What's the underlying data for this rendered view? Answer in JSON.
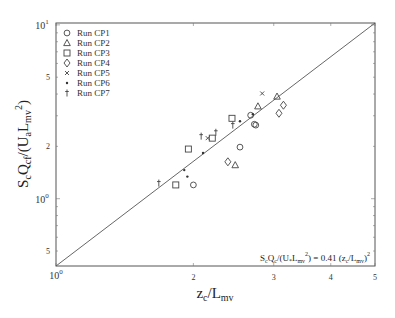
{
  "chart_data": {
    "type": "scatter",
    "title": "",
    "xlabel": "z_c/L_mv",
    "ylabel": "S_cQ_d/(U_aL_mv^2)",
    "xscale": "log",
    "yscale": "log",
    "xlim": [
      1,
      5
    ],
    "ylim": [
      0.41,
      10.25
    ],
    "x_ticks": [
      {
        "value": 1,
        "label": "10",
        "sup": "0"
      },
      {
        "value": 2,
        "label": "2"
      },
      {
        "value": 3,
        "label": "3"
      },
      {
        "value": 4,
        "label": "4"
      },
      {
        "value": 5,
        "label": "5"
      }
    ],
    "y_ticks": [
      {
        "value": 0.5,
        "label": "5"
      },
      {
        "value": 1,
        "label": "10",
        "sup": "0"
      },
      {
        "value": 2,
        "label": "2"
      },
      {
        "value": 5,
        "label": "5"
      },
      {
        "value": 10,
        "label": "10",
        "sup": "1"
      }
    ],
    "grid": false,
    "legend_position": "upper-left",
    "fit_line": {
      "coef": 0.41,
      "power": 2,
      "label": "S_cQ_c/(U_*L_mv^2) = 0.41 (z_c/L_mv)^2"
    },
    "series": [
      {
        "name": "Run CP1",
        "marker": "circle",
        "points": [
          [
            2.0,
            1.2
          ],
          [
            2.53,
            1.98
          ],
          [
            2.72,
            2.68
          ],
          [
            2.74,
            2.65
          ],
          [
            2.67,
            3.02
          ]
        ]
      },
      {
        "name": "Run CP2",
        "marker": "triangle",
        "points": [
          [
            2.47,
            1.56
          ],
          [
            2.77,
            3.4
          ],
          [
            3.05,
            3.87
          ]
        ]
      },
      {
        "name": "Run CP3",
        "marker": "square",
        "points": [
          [
            1.83,
            1.2
          ],
          [
            1.95,
            1.93
          ],
          [
            2.2,
            2.23
          ],
          [
            2.43,
            2.9
          ]
        ]
      },
      {
        "name": "Run CP4",
        "marker": "diamond",
        "points": [
          [
            2.38,
            1.63
          ],
          [
            3.08,
            3.1
          ],
          [
            3.15,
            3.45
          ]
        ]
      },
      {
        "name": "Run CP5",
        "marker": "x",
        "points": [
          [
            2.83,
            4.03
          ],
          [
            2.15,
            2.23
          ]
        ]
      },
      {
        "name": "Run CP6",
        "marker": "star",
        "points": [
          [
            1.91,
            1.46
          ],
          [
            1.94,
            1.34
          ],
          [
            2.1,
            1.83
          ],
          [
            2.53,
            2.79
          ],
          [
            2.7,
            3.06
          ]
        ]
      },
      {
        "name": "Run CP7",
        "marker": "dagger",
        "points": [
          [
            1.68,
            1.23
          ],
          [
            2.08,
            2.29
          ],
          [
            2.24,
            2.41
          ],
          [
            2.44,
            2.65
          ]
        ]
      }
    ]
  },
  "labels": {
    "x_main": "z",
    "x_sub1": "c",
    "x_mid": "/L",
    "x_sub2": "mv",
    "y_text": "S_cQ_d/(U_aL_mv^2)"
  }
}
